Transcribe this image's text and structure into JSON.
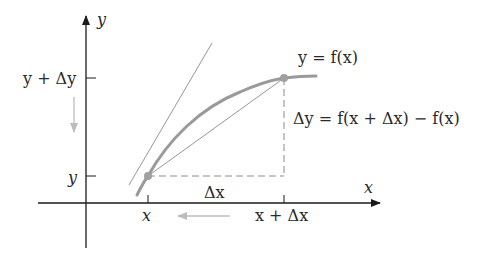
{
  "diagram": {
    "axes": {
      "x_label": "x",
      "y_label": "y"
    },
    "y_ticks": [
      {
        "label": "y + Δy",
        "position": "upper"
      },
      {
        "label": "y",
        "position": "lower"
      }
    ],
    "x_ticks": [
      {
        "label": "x",
        "position": "left"
      },
      {
        "label": "x + Δx",
        "position": "right"
      }
    ],
    "curve_label": "y = f(x)",
    "delta_x_label": "Δx",
    "delta_y_label": "Δy = f(x + Δx) − f(x)",
    "colors": {
      "axis": "#1a1a1a",
      "curve": "#9a9a9a",
      "tangent": "#8a8a8a",
      "secant": "#8a8a8a",
      "dashed": "#8a8a8a",
      "point": "#a0a0a0",
      "arrow_hint": "#bdbdbd"
    }
  }
}
